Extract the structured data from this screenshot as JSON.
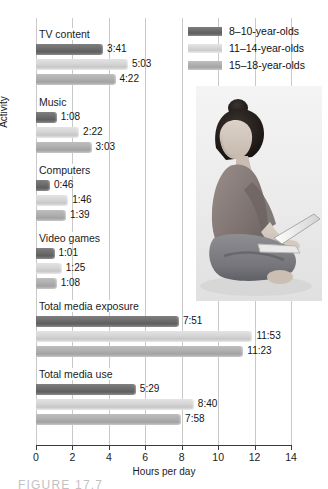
{
  "chart_data": {
    "type": "bar",
    "orientation": "horizontal",
    "title": "",
    "xlabel": "Hours per day",
    "ylabel": "Activity",
    "xlim": [
      0,
      14
    ],
    "xticks": [
      0,
      2,
      4,
      6,
      8,
      10,
      12,
      14
    ],
    "xtick_labels": [
      "0",
      "2",
      "4",
      "6",
      "8",
      "10",
      "12",
      "14"
    ],
    "grid": true,
    "legend_position": "top-right",
    "categories": [
      "TV content",
      "Music",
      "Computers",
      "Video games",
      "Total media exposure",
      "Total media use"
    ],
    "series": [
      {
        "name": "8–10-year-olds",
        "color": "#6d6d6d",
        "values": [
          3.683,
          1.133,
          0.767,
          1.017,
          7.85,
          5.483
        ],
        "labels": [
          "3:41",
          "1:08",
          "0:46",
          "1:01",
          "7:51",
          "5:29"
        ]
      },
      {
        "name": "11–14-year-olds",
        "color": "#d6d6d6",
        "values": [
          5.05,
          2.367,
          1.767,
          1.417,
          11.883,
          8.667
        ],
        "labels": [
          "5:03",
          "2:22",
          "1:46",
          "1:25",
          "11:53",
          "8:40"
        ]
      },
      {
        "name": "15–18-year-olds",
        "color": "#b0b0b0",
        "values": [
          4.367,
          3.05,
          1.65,
          1.133,
          11.383,
          7.967
        ],
        "labels": [
          "4:22",
          "3:03",
          "1:39",
          "1:08",
          "11:23",
          "7:58"
        ]
      }
    ]
  },
  "legend": {
    "items": [
      {
        "label": "8–10-year-olds",
        "swatch_class": "s0"
      },
      {
        "label": "11–14-year-olds",
        "swatch_class": "s1"
      },
      {
        "label": "15–18-year-olds",
        "swatch_class": "s2"
      }
    ]
  },
  "photo": {
    "alt": "young woman sitting cross-legged using a laptop"
  },
  "caption": {
    "text": "FIGURE 17.7"
  }
}
